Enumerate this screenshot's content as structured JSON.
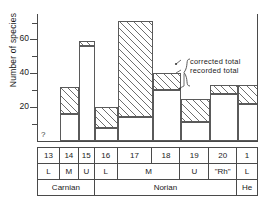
{
  "chart_data": {
    "type": "bar",
    "title": "",
    "xlabel": "",
    "ylabel": "Number of species",
    "ylim": [
      0,
      75
    ],
    "yticks": [
      0,
      10,
      20,
      30,
      40,
      50,
      60,
      70
    ],
    "ytick_labels": [
      "",
      "",
      "20",
      "",
      "40",
      "",
      "60",
      ""
    ],
    "grid": false,
    "legend_position": "inside-right",
    "categories": [
      "13",
      "14",
      "15",
      "16",
      "17",
      "18",
      "19",
      "20",
      "1"
    ],
    "series": [
      {
        "name": "recorded total",
        "values": [
          null,
          16,
          56,
          8,
          14,
          30,
          11,
          28,
          22
        ]
      },
      {
        "name": "corrected total",
        "values": [
          null,
          32,
          59,
          20,
          71,
          40,
          25,
          33,
          33
        ]
      }
    ],
    "annotations": [
      {
        "text": "corrected total",
        "target": "corrected-total-top-of-bar-19"
      },
      {
        "text": "recorded total",
        "target": "recorded-total-top-of-bar-19"
      },
      {
        "text": "?",
        "target": "zone-13-no-data"
      }
    ]
  },
  "axis": {
    "y_label": "Number of species",
    "ticks": [
      {
        "value": 70,
        "label": "",
        "major": false
      },
      {
        "value": 60,
        "label": "60",
        "major": true
      },
      {
        "value": 50,
        "label": "",
        "major": false
      },
      {
        "value": 40,
        "label": "40",
        "major": true
      },
      {
        "value": 30,
        "label": "",
        "major": false
      },
      {
        "value": 20,
        "label": "20",
        "major": true
      },
      {
        "value": 10,
        "label": "",
        "major": false
      }
    ]
  },
  "bars": [
    {
      "zone": "13",
      "recorded": null,
      "corrected": null,
      "note": "?"
    },
    {
      "zone": "14",
      "recorded": 16,
      "corrected": 32,
      "note": ""
    },
    {
      "zone": "15",
      "recorded": 56,
      "corrected": 59,
      "note": ""
    },
    {
      "zone": "16",
      "recorded": 8,
      "corrected": 20,
      "note": ""
    },
    {
      "zone": "17",
      "recorded": 14,
      "corrected": 71,
      "note": ""
    },
    {
      "zone": "18",
      "recorded": 30,
      "corrected": 40,
      "note": ""
    },
    {
      "zone": "19",
      "recorded": 11,
      "corrected": 25,
      "note": ""
    },
    {
      "zone": "20",
      "recorded": 28,
      "corrected": 33,
      "note": ""
    },
    {
      "zone": "1",
      "recorded": 22,
      "corrected": 33,
      "note": ""
    }
  ],
  "annotation": {
    "corrected_label": "corrected total",
    "recorded_label": "recorded total"
  },
  "unknown_marker": "?",
  "strat": {
    "zones": [
      "13",
      "14",
      "15",
      "16",
      "17",
      "18",
      "19",
      "20",
      "1"
    ],
    "substages": [
      "L",
      "M",
      "U",
      "L",
      "M",
      "U",
      "\"Rh\"",
      "L"
    ],
    "stages": [
      "Carnian",
      "Norian",
      "He"
    ]
  },
  "colors": {
    "line": "#4a4a4a",
    "hatch": "#6e6e6e",
    "background": "#ffffff",
    "text": "#1a1a1a"
  }
}
